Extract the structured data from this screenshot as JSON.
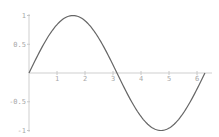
{
  "chart_data": {
    "type": "line",
    "title": "",
    "xlabel": "",
    "ylabel": "",
    "xlim": [
      0,
      6.2832
    ],
    "ylim": [
      -1,
      1
    ],
    "grid": false,
    "legend": null,
    "x_ticks": [
      "1",
      "2",
      "3",
      "4",
      "5",
      "6"
    ],
    "y_ticks": [
      "1",
      "0.5",
      "-0.5",
      "-1"
    ],
    "series": [
      {
        "name": "sin(x)",
        "function": "sin",
        "x": [
          0,
          0.5,
          1,
          1.5708,
          2,
          2.5,
          3,
          3.1416,
          3.5,
          4,
          4.7124,
          5,
          5.5,
          6,
          6.2832
        ],
        "values": [
          0,
          0.479,
          0.841,
          1,
          0.909,
          0.598,
          0.141,
          0,
          -0.351,
          -0.757,
          -1,
          -0.959,
          -0.706,
          -0.279,
          0
        ],
        "color": "#666666"
      }
    ],
    "axis_color": "#c8c8c8",
    "tick_label_color": "#a8a8a8"
  }
}
